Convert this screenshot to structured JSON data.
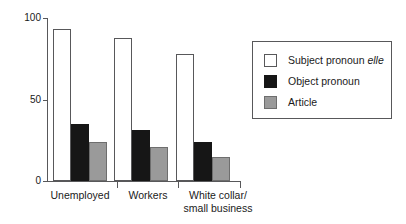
{
  "chart_data": {
    "type": "bar",
    "title": "",
    "xlabel": "",
    "ylabel": "",
    "ylim": [
      0,
      100
    ],
    "yticks": [
      0,
      50,
      100
    ],
    "ytick_labels": [
      "0",
      "50",
      "100"
    ],
    "grid": false,
    "legend_position": "right",
    "categories": [
      "Unemployed",
      "Workers",
      "White collar/\nsmall business"
    ],
    "series": [
      {
        "name": "Subject pronoun elle",
        "name_plain": "Subject pronoun ",
        "name_italic": "elle",
        "color": "#ffffff",
        "values": [
          93,
          88,
          78
        ]
      },
      {
        "name": "Object pronoun",
        "name_plain": "Object pronoun",
        "name_italic": "",
        "color": "#161616",
        "values": [
          35,
          31,
          24
        ]
      },
      {
        "name": "Article",
        "name_plain": "Article",
        "name_italic": "",
        "color": "#9a9a9a",
        "values": [
          24,
          21,
          15
        ]
      }
    ]
  },
  "axis": {
    "y_labels": [
      "100",
      "50",
      "0"
    ]
  },
  "legend": {
    "items": [
      {
        "label_plain": "Subject pronoun ",
        "label_italic": "elle",
        "swatch": "white"
      },
      {
        "label_plain": "Object pronoun",
        "label_italic": "",
        "swatch": "black"
      },
      {
        "label_plain": "Article",
        "label_italic": "",
        "swatch": "gray"
      }
    ]
  },
  "categories": {
    "items": [
      {
        "label": "Unemployed"
      },
      {
        "label": "Workers"
      },
      {
        "label": "White collar/\nsmall business"
      }
    ]
  }
}
